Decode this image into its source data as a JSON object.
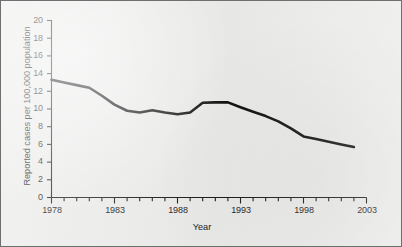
{
  "chart_data": {
    "type": "line",
    "title": "",
    "xlabel": "Year",
    "ylabel": "Reported cases per 100,000 population",
    "xlim": [
      1978,
      2003
    ],
    "ylim": [
      0,
      20
    ],
    "xticks": [
      1978,
      1983,
      1988,
      1993,
      1998,
      2003
    ],
    "xtick_labels": [
      "1978",
      "1983",
      "1988",
      "1993",
      "1998",
      "2003"
    ],
    "yticks": [
      0,
      2,
      4,
      6,
      8,
      10,
      12,
      14,
      16,
      18,
      20
    ],
    "ytick_labels": [
      "0",
      "2",
      "4",
      "6",
      "8",
      "10",
      "12",
      "14",
      "16",
      "18",
      "20"
    ],
    "minor_xtick_interval": 1,
    "grid": false,
    "legend": false,
    "line_color": "#111111",
    "line_width": 2.6,
    "series": [
      {
        "name": "Reported cases per 100,000 population",
        "x": [
          1978,
          1979,
          1980,
          1981,
          1982,
          1983,
          1984,
          1985,
          1986,
          1987,
          1988,
          1989,
          1990,
          1991,
          1992,
          1993,
          1994,
          1995,
          1996,
          1997,
          1998,
          1999,
          2000,
          2001,
          2002
        ],
        "values": [
          13.3,
          13.0,
          12.7,
          12.4,
          11.5,
          10.5,
          9.8,
          9.6,
          9.85,
          9.6,
          9.4,
          9.6,
          10.7,
          10.75,
          10.75,
          10.2,
          9.7,
          9.2,
          8.6,
          7.8,
          6.9,
          6.6,
          6.3,
          6.0,
          5.7
        ]
      }
    ]
  },
  "axis": {
    "ytick_labels": [
      "20",
      "18",
      "16",
      "14",
      "12",
      "10",
      "8",
      "6",
      "4",
      "2",
      "0"
    ],
    "xtick_labels": [
      "1978",
      "1983",
      "1988",
      "1993",
      "1998",
      "2003"
    ],
    "ylabel": "Reported cases per 100,000 population",
    "xlabel": "Year"
  }
}
